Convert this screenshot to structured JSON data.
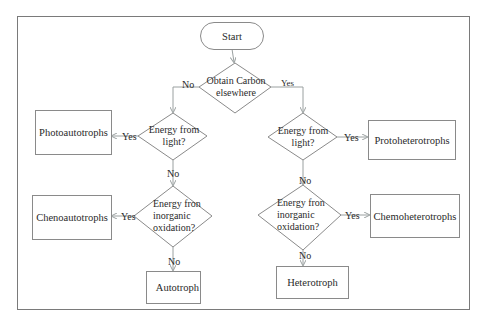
{
  "diagram": {
    "type": "flowchart",
    "colors": {
      "line": "#8a8a8a",
      "arrow": "#9aa0a0",
      "text": "#2a2a2a",
      "border": "#7a7a7a"
    },
    "nodes": {
      "start": "Start",
      "carbon_decision": {
        "line1": "Obtain Carbon",
        "line2": "elsewhere"
      },
      "left_light_decision": {
        "line1": "Energy from",
        "line2": "light?"
      },
      "left_inorganic_decision": {
        "line1": "Energy fron",
        "line2": "inorganic",
        "line3": "oxidation?"
      },
      "right_light_decision": {
        "line1": "Energy from",
        "line2": "light?"
      },
      "right_inorganic_decision": {
        "line1": "Energy fron",
        "line2": "inorganic",
        "line3": "oxidation?"
      },
      "photoautotrophs": "Photoautotrophs",
      "chenoautotrophs": "Chenoautotrophs",
      "autotroph": "Autotroph",
      "protoheterotrophs": "Protoheterotrophs",
      "chemoheterotrophs": "Chemoheterotrophs",
      "heterotroph": "Heterotroph"
    },
    "edge_labels": {
      "carbon_no": "No",
      "carbon_yes": "Yes",
      "left_light_yes": "Yes",
      "left_light_no": "No",
      "left_inorganic_yes": "Yes",
      "left_inorganic_no": "No",
      "right_light_yes": "Yes",
      "right_light_no": "No",
      "right_inorganic_yes": "Yes",
      "right_inorganic_no": "No"
    }
  }
}
